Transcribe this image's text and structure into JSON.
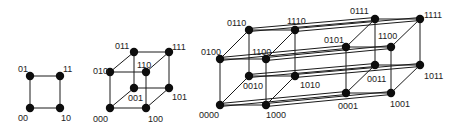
{
  "diagram": {
    "colors": {
      "edge": "#1a1a1a",
      "vertex": "#0d0d0d",
      "label": "#222222",
      "background": "#ffffff"
    },
    "figures": [
      {
        "name": "square-2d",
        "vertices": [
          {
            "id": "00",
            "label": "00",
            "x": 30,
            "y": 108,
            "lx": 18,
            "ly": 121
          },
          {
            "id": "01",
            "label": "01",
            "x": 30,
            "y": 76,
            "lx": 18,
            "ly": 72
          },
          {
            "id": "10",
            "label": "10",
            "x": 60,
            "y": 108,
            "lx": 61,
            "ly": 121
          },
          {
            "id": "11",
            "label": "11",
            "x": 60,
            "y": 76,
            "lx": 63,
            "ly": 72
          }
        ]
      },
      {
        "name": "cube-3d",
        "vertices": [
          {
            "id": "000",
            "label": "000",
            "x": 110,
            "y": 108,
            "lx": 93,
            "ly": 122
          },
          {
            "id": "001",
            "label": "001",
            "x": 134,
            "y": 88,
            "lx": 128,
            "ly": 101
          },
          {
            "id": "010",
            "label": "010",
            "x": 110,
            "y": 72,
            "lx": 93,
            "ly": 74
          },
          {
            "id": "011",
            "label": "011",
            "x": 134,
            "y": 52,
            "lx": 115,
            "ly": 49
          },
          {
            "id": "100",
            "label": "100",
            "x": 146,
            "y": 108,
            "lx": 148,
            "ly": 122
          },
          {
            "id": "101",
            "label": "101",
            "x": 169,
            "y": 88,
            "lx": 172,
            "ly": 100
          },
          {
            "id": "110",
            "label": "110",
            "x": 146,
            "y": 72,
            "lx": 137,
            "ly": 68
          },
          {
            "id": "111",
            "label": "111",
            "x": 169,
            "y": 52,
            "lx": 172,
            "ly": 50
          }
        ]
      },
      {
        "name": "tesseract-4d",
        "vertices": [
          {
            "id": "0000",
            "label": "0000",
            "x": 220,
            "y": 105,
            "lx": 199,
            "ly": 118
          },
          {
            "id": "0010",
            "label": "0010",
            "x": 249,
            "y": 76,
            "lx": 243,
            "ly": 89
          },
          {
            "id": "0100",
            "label": "0100",
            "x": 220,
            "y": 59,
            "lx": 201,
            "ly": 55
          },
          {
            "id": "0110",
            "label": "0110",
            "x": 249,
            "y": 30,
            "lx": 227,
            "ly": 26
          },
          {
            "id": "1000",
            "label": "1000",
            "x": 266,
            "y": 105,
            "lx": 266,
            "ly": 118
          },
          {
            "id": "1010",
            "label": "1010",
            "x": 295,
            "y": 76,
            "lx": 300,
            "ly": 88
          },
          {
            "id": "1100",
            "label": "1100",
            "x": 266,
            "y": 59,
            "lx": 252,
            "ly": 55
          },
          {
            "id": "1110",
            "label": "1110",
            "x": 295,
            "y": 30,
            "lx": 287,
            "ly": 24
          },
          {
            "id": "0001",
            "label": "0001",
            "x": 346,
            "y": 93,
            "lx": 338,
            "ly": 109
          },
          {
            "id": "0011",
            "label": "0011",
            "x": 375,
            "y": 65,
            "lx": 367,
            "ly": 82
          },
          {
            "id": "0101",
            "label": "0101",
            "x": 346,
            "y": 47,
            "lx": 324,
            "ly": 43
          },
          {
            "id": "0111",
            "label": "0111",
            "x": 375,
            "y": 19,
            "lx": 350,
            "ly": 14
          },
          {
            "id": "1001",
            "label": "1001",
            "x": 391,
            "y": 93,
            "lx": 390,
            "ly": 107
          },
          {
            "id": "1011",
            "label": "1011",
            "x": 420,
            "y": 65,
            "lx": 424,
            "ly": 79
          },
          {
            "id": "1101",
            "label": "1100",
            "x": 391,
            "y": 47,
            "lx": 378,
            "ly": 39
          },
          {
            "id": "1111",
            "label": "1111",
            "x": 420,
            "y": 19,
            "lx": 424,
            "ly": 18
          }
        ]
      }
    ]
  }
}
